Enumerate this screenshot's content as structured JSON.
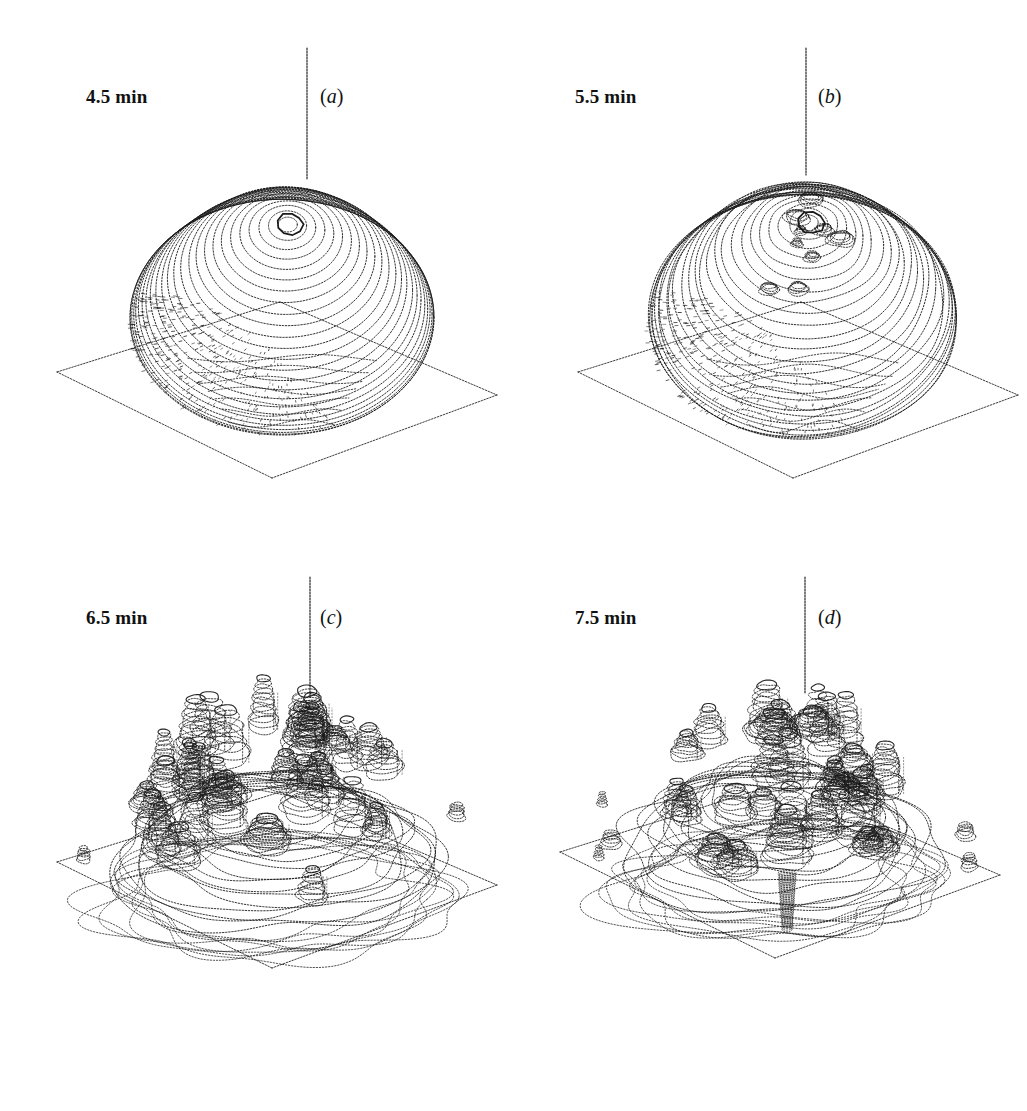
{
  "figure": {
    "background_color": "#ffffff",
    "ink_color": "#1a1a1a",
    "layout": "2x2 grid of 3D surface plots",
    "width": 1027,
    "height": 1111
  },
  "panels": [
    {
      "id": "panel-a",
      "letter": "(a)",
      "letter_open": "(",
      "letter_char": "a",
      "letter_close": ")",
      "time_label": "4.5 min",
      "time_value": 4.5,
      "time_unit": "min",
      "state": "smooth dome, single central peak",
      "peak_count": 1,
      "roughness": 0.05,
      "contour_rings": 26,
      "dome_radius_x": 152,
      "dome_radius_y": 128,
      "dome_height": 150,
      "satellites": 0
    },
    {
      "id": "panel-b",
      "letter": "(b)",
      "letter_open": "(",
      "letter_char": "b",
      "letter_close": ")",
      "time_label": "5.5 min",
      "time_value": 5.5,
      "time_unit": "min",
      "state": "dome with multiple emerging summit peaks",
      "peak_count": 9,
      "roughness": 0.3,
      "contour_rings": 26,
      "dome_radius_x": 155,
      "dome_radius_y": 132,
      "dome_height": 152,
      "satellites": 0
    },
    {
      "id": "panel-c",
      "letter": "(c)",
      "letter_open": "(",
      "letter_char": "c",
      "letter_close": ")",
      "time_label": "6.5 min",
      "time_value": 6.5,
      "time_unit": "min",
      "state": "fragmented into many columnar cells",
      "peak_count": 34,
      "roughness": 0.72,
      "contour_rings": 18,
      "dome_radius_x": 160,
      "dome_radius_y": 120,
      "dome_height": 120,
      "satellites": 2
    },
    {
      "id": "panel-d",
      "letter": "(d)",
      "letter_open": "(",
      "letter_char": "d",
      "letter_close": ")",
      "time_label": "7.5 min",
      "time_value": 7.5,
      "time_unit": "min",
      "state": "fully broken up, detached satellite fragments",
      "peak_count": 30,
      "roughness": 0.95,
      "contour_rings": 16,
      "dome_radius_x": 150,
      "dome_radius_y": 112,
      "dome_height": 118,
      "satellites": 5
    }
  ],
  "chart_data": {
    "type": "line",
    "title": "",
    "xlabel": "",
    "ylabel": "",
    "series": [
      {
        "name": "surface roughness",
        "x": [
          4.5,
          5.5,
          6.5,
          7.5
        ],
        "values": [
          0.05,
          0.3,
          0.72,
          0.95
        ]
      },
      {
        "name": "peak count",
        "x": [
          4.5,
          5.5,
          6.5,
          7.5
        ],
        "values": [
          1,
          9,
          34,
          30
        ]
      }
    ],
    "categories": [
      "4.5 min",
      "5.5 min",
      "6.5 min",
      "7.5 min"
    ],
    "xlim": [
      4.5,
      7.5
    ],
    "grid": false,
    "legend": "none"
  },
  "base_plane": {
    "shape": "rhombus",
    "stroke_color": "#444444",
    "fill_color": "#ffffff",
    "corners_note": "isometric ground plane beneath each surface"
  },
  "axis": {
    "z_axis": "thin vertical line rising from dome apex",
    "stroke_color": "#222222"
  }
}
